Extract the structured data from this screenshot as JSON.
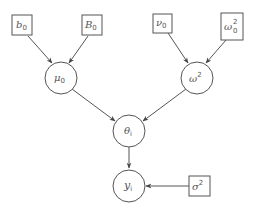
{
  "diagram": {
    "type": "bayesian-hierarchical-model",
    "nodes": {
      "b0": {
        "kind": "hyperparameter-box",
        "symbol": "b",
        "sub": "0",
        "sup": ""
      },
      "B0": {
        "kind": "hyperparameter-box",
        "symbol": "B",
        "sub": "0",
        "sup": ""
      },
      "nu0": {
        "kind": "hyperparameter-box",
        "symbol": "ν",
        "sub": "0",
        "sup": ""
      },
      "omega0sq": {
        "kind": "hyperparameter-box",
        "symbol": "ω",
        "sub": "0",
        "sup": "2"
      },
      "mu0": {
        "kind": "stochastic-circle",
        "symbol": "μ",
        "sub": "0",
        "sup": ""
      },
      "omegasq": {
        "kind": "stochastic-circle",
        "symbol": "ω",
        "sub": "",
        "sup": "2"
      },
      "theta_i": {
        "kind": "stochastic-circle",
        "symbol": "θ",
        "sub": "i",
        "sup": ""
      },
      "y_i": {
        "kind": "observed-circle",
        "symbol": "y",
        "sub": "i",
        "sup": ""
      },
      "sigmasq": {
        "kind": "hyperparameter-box",
        "symbol": "σ",
        "sub": "",
        "sup": "2"
      }
    },
    "edges": [
      {
        "from": "b0",
        "to": "mu0"
      },
      {
        "from": "B0",
        "to": "mu0"
      },
      {
        "from": "nu0",
        "to": "omegasq"
      },
      {
        "from": "omega0sq",
        "to": "omegasq"
      },
      {
        "from": "mu0",
        "to": "theta_i"
      },
      {
        "from": "omegasq",
        "to": "theta_i"
      },
      {
        "from": "theta_i",
        "to": "y_i"
      },
      {
        "from": "sigmasq",
        "to": "y_i"
      }
    ],
    "colors": {
      "stroke": "#555555",
      "background": "#ffffff"
    }
  }
}
